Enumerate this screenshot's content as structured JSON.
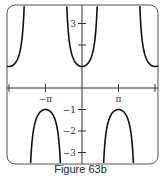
{
  "caption": "Figure 63b",
  "chart_data": {
    "type": "line",
    "title": "",
    "function": "y = sec(x)",
    "xlabel": "",
    "ylabel": "",
    "xlim": [
      -6.45,
      6.45
    ],
    "ylim": [
      -3.6,
      4
    ],
    "x_ticks": [
      {
        "value": -6.2832,
        "label": ""
      },
      {
        "value": -3.1416,
        "label": "−π"
      },
      {
        "value": 3.1416,
        "label": "π"
      },
      {
        "value": 6.2832,
        "label": ""
      }
    ],
    "y_ticks": [
      {
        "value": 2,
        "label": ""
      },
      {
        "value": 3,
        "label": "3"
      },
      {
        "value": -1,
        "label": "−1"
      },
      {
        "value": -2,
        "label": "−2"
      },
      {
        "value": -3,
        "label": "−3"
      }
    ],
    "series": [
      {
        "name": "sec(x)",
        "branches": "upward branches with minimum 1 at x = −2π, 0, 2π; downward branches with maximum −1 at x = −π, π; vertical asymptotes at odd multiples of π/2"
      }
    ],
    "grid": false,
    "frame": "rounded rectangle"
  }
}
